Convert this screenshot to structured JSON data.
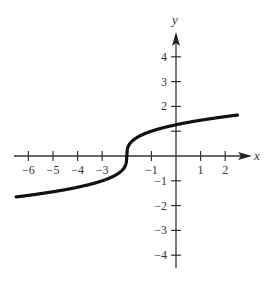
{
  "chart_data": {
    "type": "line",
    "title": "",
    "xlabel": "x",
    "ylabel": "y",
    "xlim": [
      -6.5,
      2.5
    ],
    "ylim": [
      -4.5,
      4.5
    ],
    "grid": false,
    "x_ticks": [
      -6,
      -5,
      -4,
      -3,
      -1,
      1,
      2
    ],
    "x_tick_marks": [
      -6,
      -5,
      -4,
      -3,
      -2,
      -1,
      1,
      2
    ],
    "y_ticks": [
      4,
      3,
      2,
      1,
      -1,
      -2,
      -3,
      -4
    ],
    "y_tick_labels_shown": [
      4,
      3,
      2,
      -1,
      -2,
      -3,
      -4
    ],
    "series": [
      {
        "name": "y = cbrt(x + 2)",
        "function": "cube root of (x + 2)",
        "x": [
          -6.5,
          -5,
          -4,
          -3,
          -2.5,
          -2.1,
          -2,
          -1.9,
          -1.5,
          -1,
          0,
          1,
          2,
          2.5
        ],
        "y": [
          -1.65,
          -1.44,
          -1.26,
          -1.0,
          -0.79,
          -0.46,
          0.0,
          0.46,
          0.79,
          1.0,
          1.26,
          1.44,
          1.59,
          1.65
        ],
        "color": "#111111"
      }
    ]
  },
  "labels": {
    "x_axis": "x",
    "y_axis": "y",
    "x_tick_text": [
      "−6",
      "−5",
      "−4",
      "−3",
      "−1",
      "1",
      "2"
    ],
    "y_tick_text_pos": [
      "4",
      "3",
      "2"
    ],
    "y_tick_text_neg": [
      "−1",
      "−2",
      "−3",
      "−4"
    ]
  }
}
